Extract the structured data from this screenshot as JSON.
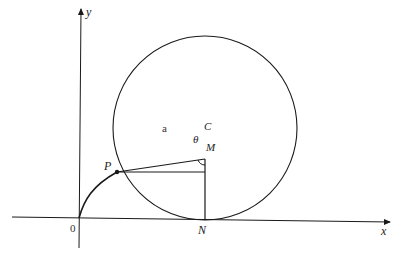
{
  "diagram": {
    "type": "geometry-cycloid-construction",
    "axes": {
      "x_label": "x",
      "y_label": "y",
      "origin_label": "0"
    },
    "points": {
      "P": "P",
      "C": "C",
      "M": "M",
      "N": "N"
    },
    "segment_labels": {
      "PC": "a"
    },
    "angle_labels": {
      "PCM": "θ"
    },
    "colors": {
      "stroke": "#1a1a1a",
      "background": "#ffffff"
    }
  }
}
